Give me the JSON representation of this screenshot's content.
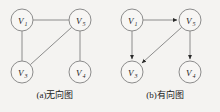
{
  "figure": {
    "background_color": "#f4f3f1",
    "stroke_color": "#8c8c8c",
    "label_color": "#1c1c1c"
  },
  "panels": [
    {
      "id": "undirected",
      "caption": "(a)无向图",
      "directed": false,
      "nodes": [
        {
          "id": "v1",
          "letter": "V",
          "subscript": "1",
          "cx": 22,
          "cy": 20,
          "r": 11
        },
        {
          "id": "v5",
          "letter": "V",
          "subscript": "5",
          "cx": 80,
          "cy": 20,
          "r": 11
        },
        {
          "id": "v3",
          "letter": "V",
          "subscript": "3",
          "cx": 22,
          "cy": 72,
          "r": 11
        },
        {
          "id": "v4",
          "letter": "V",
          "subscript": "4",
          "cx": 80,
          "cy": 72,
          "r": 11
        }
      ],
      "edges": [
        {
          "from": "v1",
          "to": "v5",
          "kind": "undirected"
        },
        {
          "from": "v1",
          "to": "v3",
          "kind": "undirected"
        },
        {
          "from": "v5",
          "to": "v4",
          "kind": "undirected"
        },
        {
          "from": "v3",
          "to": "v5",
          "kind": "undirected"
        }
      ]
    },
    {
      "id": "directed",
      "caption": "(b)有向图",
      "directed": true,
      "nodes": [
        {
          "id": "v1",
          "letter": "V",
          "subscript": "1",
          "cx": 22,
          "cy": 20,
          "r": 11
        },
        {
          "id": "v5",
          "letter": "V",
          "subscript": "5",
          "cx": 80,
          "cy": 20,
          "r": 11
        },
        {
          "id": "v3",
          "letter": "V",
          "subscript": "3",
          "cx": 22,
          "cy": 72,
          "r": 11
        },
        {
          "id": "v4",
          "letter": "V",
          "subscript": "4",
          "cx": 80,
          "cy": 72,
          "r": 11
        }
      ],
      "edges": [
        {
          "from": "v1",
          "to": "v5",
          "kind": "directed"
        },
        {
          "from": "v1",
          "to": "v3",
          "kind": "directed"
        },
        {
          "from": "v5",
          "to": "v3",
          "kind": "directed"
        },
        {
          "from": "v5",
          "to": "v4",
          "kind": "directed"
        }
      ]
    }
  ]
}
